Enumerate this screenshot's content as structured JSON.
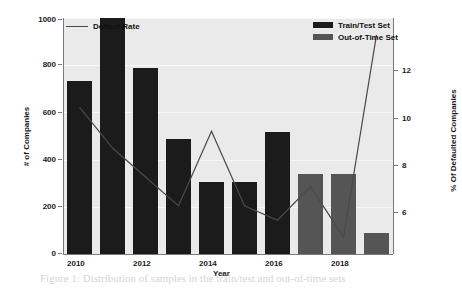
{
  "figure": {
    "background": "#ffffff",
    "plot_background": "#eaeaea",
    "train_color": "#1b1b1b",
    "oot_color": "#555555",
    "line_color": "#4a4a4a"
  },
  "legend": {
    "line_entry": "Default Rate",
    "bar_entry_1": "Train/Test Set",
    "bar_entry_2": "Out-of-Time  Set"
  },
  "axes": {
    "xlabel": "Year",
    "ylabel_left": "# of Companies",
    "ylabel_right": "% Of Defaulted Companies",
    "left_ticks": [
      "0",
      "200",
      "400",
      "600",
      "800",
      "1000"
    ],
    "right_ticks": [
      "6",
      "8",
      "10",
      "12"
    ],
    "x_ticks": [
      "2010",
      "2012",
      "2014",
      "2016",
      "2018"
    ]
  },
  "ghost_text": [
    {
      "x": 72,
      "y": 26,
      "text": "investigate the impact to our models if we drop"
    },
    {
      "x": 72,
      "y": 42,
      "text": "of companies in a dataset. Instead , a selection of"
    },
    {
      "x": 72,
      "y": 58,
      "text": "their ratio. Approximately 8,000 companies from"
    },
    {
      "x": 72,
      "y": 74,
      "text": "were sampled on the scheduled dates set up"
    },
    {
      "x": 72,
      "y": 90,
      "text": "were trained. Distribution of samples in each"
    },
    {
      "x": 72,
      "y": 106,
      "text": "with percentages of defaults in a set is"
    },
    {
      "x": 72,
      "y": 122,
      "text": "presented in the following figure:"
    },
    {
      "x": 78,
      "y": 206,
      "text": "not available"
    },
    {
      "x": 78,
      "y": 228,
      "text": "8,000"
    },
    {
      "x": 40,
      "y": 272,
      "text": "Figure 1: Distribution of samples in the train/test and out-of-time sets"
    }
  ],
  "chart_data": {
    "type": "bar",
    "title": "",
    "xlabel": "Year",
    "ylabel": "# of Companies",
    "ylabel_secondary": "% Of Defaulted Companies",
    "categories": [
      "2010",
      "2011",
      "2012",
      "2013",
      "2014",
      "2015",
      "2016",
      "2017",
      "2018",
      "2019"
    ],
    "ylim": [
      0,
      1000
    ],
    "ylim_secondary": [
      4.2,
      14.0
    ],
    "grid": true,
    "legend_position": "top",
    "series": [
      {
        "name": "Train/Test Set",
        "type": "bar",
        "color": "#1b1b1b",
        "axis": "left",
        "values": [
          733,
          1000,
          789,
          487,
          306,
          306,
          517,
          null,
          null,
          null
        ]
      },
      {
        "name": "Out-of-Time  Set",
        "type": "bar",
        "color": "#555555",
        "axis": "left",
        "values": [
          null,
          null,
          null,
          null,
          null,
          null,
          null,
          340,
          340,
          90
        ]
      },
      {
        "name": "Default Rate",
        "type": "line",
        "color": "#4a4a4a",
        "axis": "right",
        "values": [
          10.3,
          8.6,
          7.4,
          6.2,
          9.3,
          6.2,
          5.6,
          7.0,
          4.9,
          13.3
        ]
      }
    ]
  }
}
